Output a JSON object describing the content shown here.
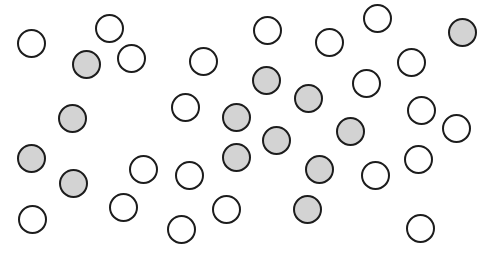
{
  "figure": {
    "width": 490,
    "height": 260,
    "radius": 14.5,
    "colors": {
      "outline": "#1c1c1c",
      "filled": "#d3d3d3",
      "empty": "#ffffff"
    },
    "counts": {
      "filled": 13,
      "empty": 21,
      "total": 34
    },
    "circles": [
      {
        "x": 31,
        "y": 43,
        "filled": false
      },
      {
        "x": 109,
        "y": 28,
        "filled": false
      },
      {
        "x": 86,
        "y": 64,
        "filled": true
      },
      {
        "x": 131,
        "y": 58,
        "filled": false
      },
      {
        "x": 203,
        "y": 61,
        "filled": false
      },
      {
        "x": 72,
        "y": 118,
        "filled": true
      },
      {
        "x": 185,
        "y": 107,
        "filled": false
      },
      {
        "x": 31,
        "y": 158,
        "filled": true
      },
      {
        "x": 73,
        "y": 183,
        "filled": true
      },
      {
        "x": 143,
        "y": 169,
        "filled": false
      },
      {
        "x": 189,
        "y": 175,
        "filled": false
      },
      {
        "x": 123,
        "y": 207,
        "filled": false
      },
      {
        "x": 32,
        "y": 219,
        "filled": false
      },
      {
        "x": 181,
        "y": 229,
        "filled": false
      },
      {
        "x": 226,
        "y": 209,
        "filled": false
      },
      {
        "x": 236,
        "y": 117,
        "filled": true
      },
      {
        "x": 236,
        "y": 157,
        "filled": true
      },
      {
        "x": 266,
        "y": 80,
        "filled": true
      },
      {
        "x": 276,
        "y": 140,
        "filled": true
      },
      {
        "x": 267,
        "y": 30,
        "filled": false
      },
      {
        "x": 308,
        "y": 98,
        "filled": true
      },
      {
        "x": 329,
        "y": 42,
        "filled": false
      },
      {
        "x": 350,
        "y": 131,
        "filled": true
      },
      {
        "x": 319,
        "y": 169,
        "filled": true
      },
      {
        "x": 307,
        "y": 209,
        "filled": true
      },
      {
        "x": 377,
        "y": 18,
        "filled": false
      },
      {
        "x": 366,
        "y": 83,
        "filled": false
      },
      {
        "x": 375,
        "y": 175,
        "filled": false
      },
      {
        "x": 411,
        "y": 62,
        "filled": false
      },
      {
        "x": 421,
        "y": 110,
        "filled": false
      },
      {
        "x": 418,
        "y": 159,
        "filled": false
      },
      {
        "x": 420,
        "y": 228,
        "filled": false
      },
      {
        "x": 456,
        "y": 128,
        "filled": false
      },
      {
        "x": 462,
        "y": 32,
        "filled": true
      }
    ]
  }
}
